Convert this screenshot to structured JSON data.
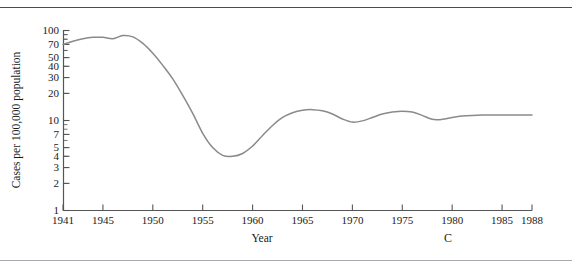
{
  "figure": {
    "panel_label": "C",
    "axis_color": "#555555",
    "curve_color": "#8a8a8a",
    "text_color": "#1a1a1a"
  },
  "chart_data": {
    "type": "line",
    "title": "",
    "subtitle": "",
    "xlabel": "Year",
    "ylabel": "Cases per 100,000 population",
    "yscale": "log",
    "ylim": [
      1,
      100
    ],
    "xlim": [
      1941,
      1988
    ],
    "grid": false,
    "legend": "none",
    "ytick_labels": [
      "100",
      "70",
      "50",
      "40",
      "30",
      "20",
      "10",
      "7",
      "5",
      "4",
      "3",
      "2",
      "1"
    ],
    "ytick_values": [
      100,
      70,
      50,
      40,
      30,
      20,
      10,
      7,
      5,
      4,
      3,
      2,
      1
    ],
    "xtick_labels": [
      "1941",
      "1945",
      "1950",
      "1955",
      "1960",
      "1965",
      "1970",
      "1975",
      "1980",
      "1985",
      "1988"
    ],
    "xtick_values": [
      1941,
      1945,
      1950,
      1955,
      1960,
      1965,
      1970,
      1975,
      1980,
      1985,
      1988
    ],
    "series": [
      {
        "name": "Cases per 100,000 population",
        "x": [
          1941,
          1942,
          1943,
          1944,
          1945,
          1946,
          1947,
          1948,
          1949,
          1950,
          1951,
          1952,
          1953,
          1954,
          1955,
          1956,
          1957,
          1958,
          1959,
          1960,
          1961,
          1962,
          1963,
          1964,
          1965,
          1966,
          1967,
          1968,
          1969,
          1970,
          1971,
          1972,
          1973,
          1974,
          1975,
          1976,
          1977,
          1978,
          1979,
          1980,
          1981,
          1982,
          1983,
          1984,
          1985,
          1986,
          1987,
          1988
        ],
        "values": [
          70,
          76,
          81,
          84,
          84,
          81,
          88,
          85,
          72,
          56,
          41,
          29,
          19,
          12,
          7.2,
          5.0,
          4.1,
          4.0,
          4.3,
          5.2,
          6.8,
          8.8,
          10.8,
          12.2,
          13.0,
          13.2,
          12.8,
          11.8,
          10.4,
          9.6,
          9.9,
          10.8,
          11.8,
          12.4,
          12.7,
          12.4,
          11.4,
          10.3,
          10.3,
          10.8,
          11.2,
          11.4,
          11.5,
          11.5,
          11.5,
          11.5,
          11.5,
          11.5
        ]
      }
    ]
  }
}
